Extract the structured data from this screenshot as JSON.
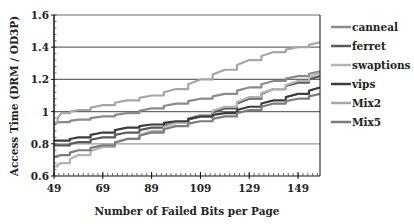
{
  "chart_data": {
    "type": "line",
    "title": "",
    "xlabel": "Number of Failed Bits per Page",
    "ylabel": "Access Time (DRM / OD3P)",
    "xlim": [
      49,
      158
    ],
    "ylim": [
      0.6,
      1.6
    ],
    "x_ticks": [
      49,
      69,
      89,
      109,
      129,
      149
    ],
    "x_tick_labels": [
      "49",
      "69",
      "89",
      "109",
      "129",
      "149"
    ],
    "y_ticks": [
      0.6,
      0.8,
      1.0,
      1.2,
      1.4,
      1.6
    ],
    "y_tick_labels": [
      "0.6",
      "0.8",
      "1",
      "1.2",
      "1.4",
      "1.6"
    ],
    "grid": "horizontal",
    "legend_position": "right",
    "x": [
      49,
      52,
      59,
      69,
      79,
      89,
      99,
      109,
      119,
      129,
      139,
      149,
      158
    ],
    "series": [
      {
        "name": "canneal",
        "color": "#8a8a8a",
        "values": [
          0.93,
          0.935,
          0.95,
          0.97,
          0.99,
          1.02,
          1.05,
          1.08,
          1.11,
          1.15,
          1.19,
          1.22,
          1.25
        ]
      },
      {
        "name": "ferret",
        "color": "#5a5a5a",
        "values": [
          0.79,
          0.79,
          0.81,
          0.84,
          0.87,
          0.9,
          0.93,
          0.97,
          1.02,
          1.08,
          1.14,
          1.18,
          1.22
        ]
      },
      {
        "name": "swaptions",
        "color": "#b4b4b4",
        "values": [
          0.66,
          0.68,
          0.73,
          0.78,
          0.83,
          0.88,
          0.93,
          0.98,
          1.03,
          1.09,
          1.14,
          1.19,
          1.24
        ]
      },
      {
        "name": "vips",
        "color": "#3c3c3c",
        "values": [
          0.82,
          0.82,
          0.84,
          0.87,
          0.9,
          0.92,
          0.94,
          0.97,
          0.99,
          1.03,
          1.07,
          1.11,
          1.15
        ]
      },
      {
        "name": "Mix2",
        "color": "#a6a6a6",
        "values": [
          0.93,
          0.99,
          1.01,
          1.04,
          1.07,
          1.1,
          1.14,
          1.2,
          1.26,
          1.32,
          1.37,
          1.4,
          1.43
        ]
      },
      {
        "name": "Mix5",
        "color": "#7c7c7c",
        "values": [
          0.72,
          0.73,
          0.76,
          0.79,
          0.83,
          0.87,
          0.91,
          0.94,
          0.97,
          1.01,
          1.05,
          1.08,
          1.11
        ]
      }
    ]
  }
}
